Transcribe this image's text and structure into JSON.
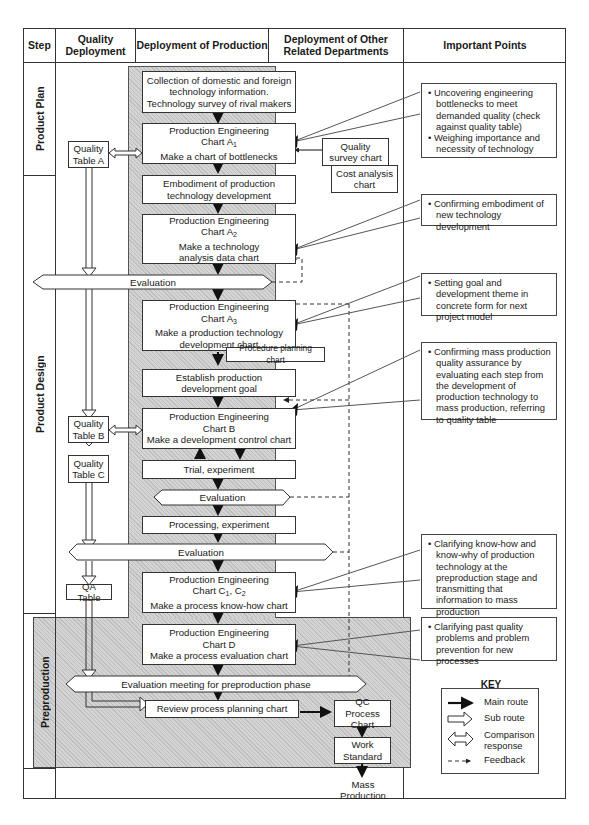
{
  "header": {
    "step": "Step",
    "quality_deployment": "Quality Deployment",
    "deployment_of_production": "Deployment of Production",
    "deployment_other": "Deployment of Other Related Departments",
    "important_points": "Important Points"
  },
  "steps": {
    "product_plan": "Product Plan",
    "product_design": "Product Design",
    "preproduction": "Preproduction"
  },
  "quality_tables": {
    "a": "Quality Table A",
    "b": "Quality Table B",
    "c": "Quality Table C",
    "qa": "QA Table"
  },
  "production": {
    "collection": "Collection of domestic and foreign technology information. Technology survey of rival makers",
    "pe_a1_title": "Production Engineering",
    "pe_a1_chart": "Chart A",
    "pe_a1_sub": "1",
    "pe_a1_task": "Make a chart of bottlenecks",
    "embodiment": "Embodiment of production technology development",
    "pe_a2_title": "Production Engineering",
    "pe_a2_chart": "Chart A",
    "pe_a2_sub": "2",
    "pe_a2_task": "Make a technology analysis data chart",
    "evaluation_1": "Evaluation",
    "pe_a3_title": "Production Engineering",
    "pe_a3_chart": "Chart A",
    "pe_a3_sub": "3",
    "pe_a3_task": "Make a production technology development chart",
    "procedure_planning": "Procedure planning chart",
    "establish_goal": "Establish production development goal",
    "pe_b_title": "Production Engineering",
    "pe_b_chart": "Chart B",
    "pe_b_task": "Make a development control chart",
    "trial": "Trial, experiment",
    "evaluation_2": "Evaluation",
    "processing": "Processing, experiment",
    "evaluation_3": "Evaluation",
    "pe_c_title": "Production Engineering",
    "pe_c_chart": "Chart C",
    "pe_c_sub1": "1",
    "pe_c_mid": ", C",
    "pe_c_sub2": "2",
    "pe_c_task": "Make a process know-how chart",
    "pe_d_title": "Production Engineering",
    "pe_d_chart": "Chart D",
    "pe_d_task": "Make a process evaluation chart",
    "evaluation_meeting": "Evaluation meeting for preproduction phase",
    "review": "Review process planning chart"
  },
  "other_departments": {
    "quality_survey": "Quality survey chart",
    "cost_analysis": "Cost analysis chart",
    "qc_process": "QC Process Chart",
    "work_standard": "Work Standard",
    "mass_production": "Mass Production"
  },
  "important_points": [
    {
      "bullets": [
        "Uncovering engineering bottlenecks to meet demanded quality (check against quality table)",
        "Weighing importance and necessity of technology"
      ]
    },
    {
      "bullets": [
        "Confirming embodiment of new technology development"
      ]
    },
    {
      "bullets": [
        "Setting goal and development theme in concrete form for next  project model"
      ]
    },
    {
      "bullets": [
        "Confirming mass production quality assurance by evaluating each step from the development of production technology to mass production, referring to quality table"
      ]
    },
    {
      "bullets": [
        "Clarifying know-how and know-why of production technology at the preproduction stage and transmitting that information to mass production"
      ]
    },
    {
      "bullets": [
        "Clarifying past quality problems and problem prevention for new processes"
      ]
    }
  ],
  "key": {
    "title": "KEY",
    "items": [
      {
        "symbol": "main-route-arrow",
        "label": "Main route"
      },
      {
        "symbol": "sub-route-arrow",
        "label": "Sub route"
      },
      {
        "symbol": "comparison-response-arrow",
        "label": "Comparison response"
      },
      {
        "symbol": "feedback-arrow",
        "label": "Feedback"
      }
    ]
  },
  "colors": {
    "line": "#333333",
    "shade": "#d4d4d4",
    "background": "#ffffff"
  }
}
